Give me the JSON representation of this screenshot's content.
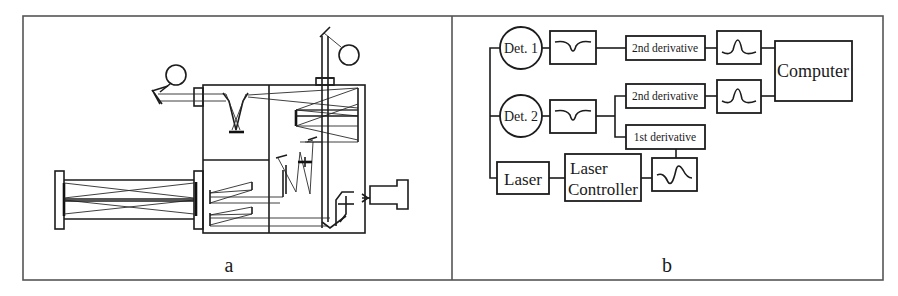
{
  "figure": {
    "panels": [
      {
        "id": "a",
        "caption": "a",
        "description": "Optical layout: multipass cells, mirrors, two detectors, laser source"
      },
      {
        "id": "b",
        "caption": "b",
        "description": "Signal processing block diagram"
      }
    ]
  },
  "panel_b": {
    "det1": "Det. 1",
    "det2": "Det. 2",
    "second_derivative_1": "2nd derivative",
    "second_derivative_2": "2nd derivative",
    "first_derivative": "1st derivative",
    "computer": "Computer",
    "laser": "Laser",
    "laser_controller_line1": "Laser",
    "laser_controller_line2": "Controller"
  },
  "panel_a": {
    "components": [
      "detector-1",
      "detector-2",
      "multipass-cell-long",
      "multipass-cell-main",
      "laser-module",
      "focusing-mirrors",
      "beam-splitter"
    ]
  }
}
